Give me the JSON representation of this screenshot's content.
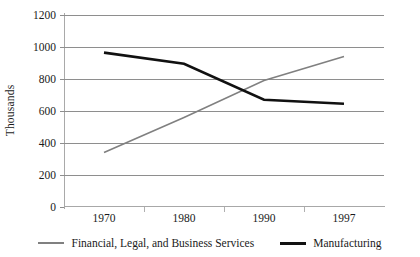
{
  "chart_data": {
    "type": "line",
    "title": "",
    "xlabel": "",
    "ylabel": "Thousands",
    "categories": [
      "1970",
      "1980",
      "1990",
      "1997"
    ],
    "ylim": [
      0,
      1200
    ],
    "yticks": [
      "0",
      "200",
      "400",
      "600",
      "800",
      "1000",
      "1200"
    ],
    "grid": true,
    "legend_position": "bottom",
    "series": [
      {
        "name": "Financial, Legal, and Business Services",
        "color": "#808080",
        "values": [
          340,
          560,
          790,
          940
        ]
      },
      {
        "name": "Manufacturing",
        "color": "#111111",
        "values": [
          965,
          895,
          670,
          645
        ]
      }
    ]
  }
}
